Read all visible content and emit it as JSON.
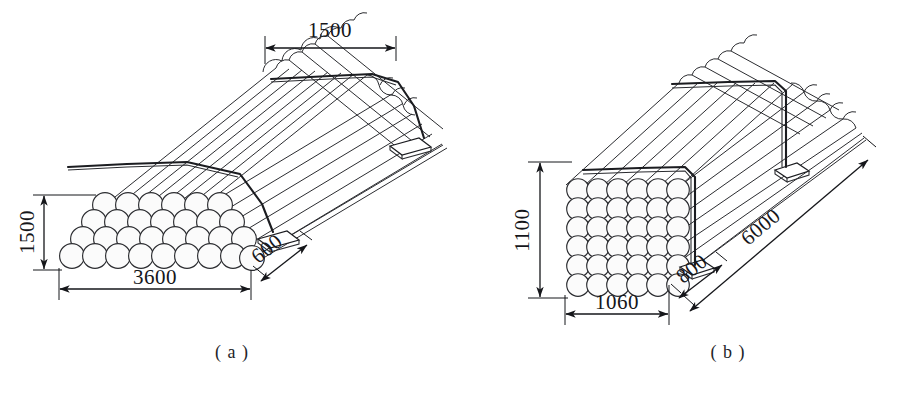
{
  "figure": {
    "type": "engineering-drawing",
    "panels": [
      {
        "id": "a",
        "caption": "( a )",
        "stack": {
          "arrangement": "staggered",
          "rows": 4,
          "circles_per_row": [
            8,
            9,
            9,
            10
          ]
        },
        "dimensions": [
          {
            "name": "top-width",
            "value": "1500",
            "unit": "mm",
            "position": "top"
          },
          {
            "name": "stack-height",
            "value": "1500",
            "unit": "mm",
            "position": "left",
            "rotated": true
          },
          {
            "name": "stack-width",
            "value": "3600",
            "unit": "mm",
            "position": "bottom"
          },
          {
            "name": "support-depth",
            "value": "600",
            "unit": "mm",
            "position": "bottom-right",
            "rotated": true
          }
        ]
      },
      {
        "id": "b",
        "caption": "( b )",
        "stack": {
          "arrangement": "grid",
          "rows": 6,
          "columns": 6
        },
        "dimensions": [
          {
            "name": "stack-height",
            "value": "1100",
            "unit": "mm",
            "position": "left",
            "rotated": true
          },
          {
            "name": "stack-width",
            "value": "1060",
            "unit": "mm",
            "position": "bottom"
          },
          {
            "name": "support-depth",
            "value": "800",
            "unit": "mm",
            "position": "bottom-right",
            "rotated": true
          },
          {
            "name": "bundle-length",
            "value": "6000",
            "unit": "mm",
            "position": "right",
            "rotated": true
          }
        ]
      }
    ],
    "colors": {
      "line": "#2b2c30",
      "strap": "#1b1c20",
      "text": "#15161a",
      "background": "#ffffff",
      "fill": "#fbfbfb"
    }
  }
}
